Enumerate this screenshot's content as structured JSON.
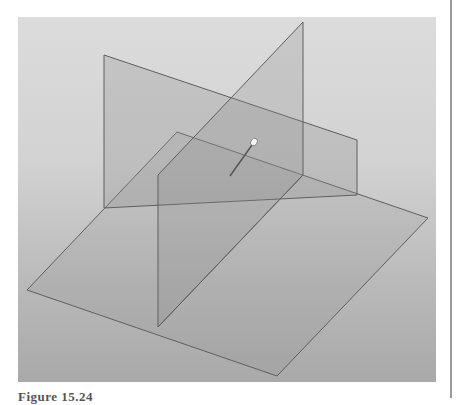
{
  "figure": {
    "caption": "Figure 15.24"
  },
  "colors": {
    "background_top": "#dcdcdc",
    "background_bottom": "#a9a9a9",
    "plane_fill": "#8c8c8c",
    "edge": "#5f5f5f",
    "frame_rule": "#9a9a9a"
  },
  "planes": {
    "horizontal": {
      "name": "horizontal-plane",
      "points": "177,132 428,218 277,376 27,290"
    },
    "frontal": {
      "name": "frontal-plane",
      "points": "104,55 357,140 357,195 303,175 158,227 104,208"
    },
    "profile": {
      "name": "profile-plane",
      "points": "158,175 303,22 303,175 158,327"
    }
  },
  "marker": {
    "name": "pin-marker",
    "head": [
      254,
      142
    ],
    "tail": [
      230,
      176
    ]
  }
}
